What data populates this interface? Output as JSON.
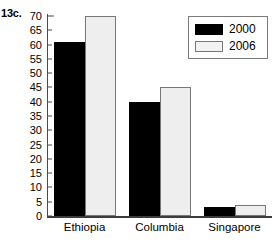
{
  "figure": {
    "number_label": "13c."
  },
  "legend": {
    "position": "top-right-inside",
    "entries": [
      {
        "label": "2000",
        "color": "#000000",
        "swatch": "legend-swatch-2000"
      },
      {
        "label": "2006",
        "color": "#eeeeee",
        "swatch": "legend-swatch-2006"
      }
    ]
  },
  "axis": {
    "y_ticks": [
      "70",
      "65",
      "60",
      "55",
      "50",
      "45",
      "40",
      "35",
      "30",
      "25",
      "20",
      "15",
      "10",
      "5",
      "0"
    ],
    "x_labels": [
      "Ethiopia",
      "Columbia",
      "Singapore"
    ]
  },
  "chart_data": {
    "type": "bar",
    "title": "13c.",
    "xlabel": "",
    "ylabel": "",
    "categories": [
      "Ethiopia",
      "Columbia",
      "Singapore"
    ],
    "series": [
      {
        "name": "2000",
        "color": "#000000",
        "values": [
          61,
          40,
          3
        ]
      },
      {
        "name": "2006",
        "color": "#eeeeee",
        "values": [
          70,
          45,
          4
        ]
      }
    ],
    "ylim": [
      0,
      70
    ],
    "ytick_step": 5,
    "grid": false,
    "legend_position": "upper right"
  }
}
